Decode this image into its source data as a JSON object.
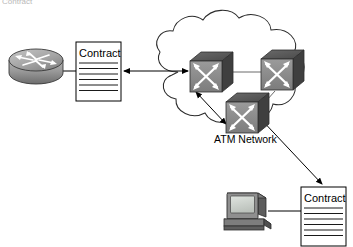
{
  "page": {
    "width": 353,
    "height": 247,
    "background": "#ffffff",
    "clipped_caption": "Contract"
  },
  "palette": {
    "stroke": "#000000",
    "outline": "#1a1a1a",
    "cloud_line": "#2b2b2b",
    "doc_fill": "#ffffff",
    "doc_rule": "#000000",
    "switch_front": "#8c8c8c",
    "switch_top": "#555555",
    "switch_side": "#3d3d3d",
    "switch_arrow": "#ffffff",
    "router_body": "#9a9a9a",
    "router_top": "#b5b5b5",
    "router_shadow": "#6f6f6f",
    "router_arrow": "#ffffff",
    "monitor_case": "#8f8f8f",
    "monitor_screen": "#cfd4cf",
    "monitor_dark": "#4a4a4a",
    "computer_base": "#7d7d7d",
    "faint_text": "#b9b9b9"
  },
  "nodes": {
    "router": {
      "label": "router-icon",
      "cx": 35,
      "cy": 66
    },
    "contract_left": {
      "title": "Contract",
      "x": 76,
      "y": 42,
      "w": 45,
      "h": 59,
      "rule_count": 6
    },
    "contract_right": {
      "title": "Contract",
      "x": 301,
      "y": 187,
      "w": 45,
      "h": 59,
      "rule_count": 6
    },
    "computer": {
      "label": "desktop-computer-icon",
      "x": 222,
      "y": 193
    },
    "switch_1": {
      "label": "atm-switch-icon",
      "x": 190,
      "y": 48
    },
    "switch_2": {
      "label": "atm-switch-icon",
      "x": 259,
      "y": 47
    },
    "switch_3": {
      "label": "atm-switch-icon",
      "x": 225,
      "y": 90
    }
  },
  "cloud": {
    "label": "ATM Network",
    "label_x": 248,
    "label_y": 140
  },
  "links": [
    {
      "id": "router-to-contract",
      "kind": "line"
    },
    {
      "id": "contract-to-cloud",
      "kind": "double-arrow"
    },
    {
      "id": "switch1-to-switch2",
      "kind": "line"
    },
    {
      "id": "switch1-to-switch3",
      "kind": "double-arrow"
    },
    {
      "id": "switch2-to-switch3",
      "kind": "line"
    },
    {
      "id": "switch3-to-contract-right",
      "kind": "double-arrow"
    },
    {
      "id": "computer-to-contract-right",
      "kind": "line"
    }
  ]
}
